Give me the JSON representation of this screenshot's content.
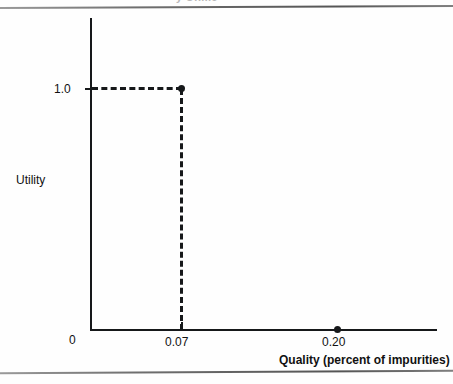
{
  "figure": {
    "clipped_caption": "y Onme"
  },
  "chart_data": {
    "type": "scatter",
    "title": "",
    "xlabel": "Quality (percent of impurities)",
    "ylabel": "Utility",
    "xlim": [
      0,
      0.26
    ],
    "ylim": [
      0,
      1.18
    ],
    "grid": false,
    "legend": null,
    "x_tick_labels": [
      "0",
      "0.07",
      "0.20"
    ],
    "x_tick_values": [
      0,
      0.07,
      0.2
    ],
    "y_tick_labels": [
      "1.0"
    ],
    "y_tick_values": [
      1.0
    ],
    "points": [
      {
        "label": "0.07",
        "x": 0.07,
        "y": 1.0
      },
      {
        "label": "0.20",
        "x": 0.2,
        "y": 0.0
      }
    ],
    "annotations": [
      {
        "type": "dashed-horizontal",
        "from_x": 0,
        "to_x": 0.07,
        "y": 1.0
      },
      {
        "type": "dashed-vertical",
        "x": 0.07,
        "from_y": 0,
        "to_y": 1.0
      }
    ]
  }
}
